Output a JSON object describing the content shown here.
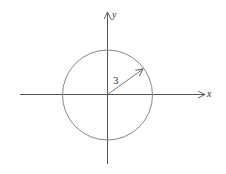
{
  "diagram": {
    "type": "circle-on-axes",
    "x_axis_label": "x",
    "y_axis_label": "y",
    "radius_label": "3",
    "colors": {
      "axes": "#555555",
      "circle": "#888888",
      "radius": "#777777",
      "text": "#333333"
    }
  }
}
